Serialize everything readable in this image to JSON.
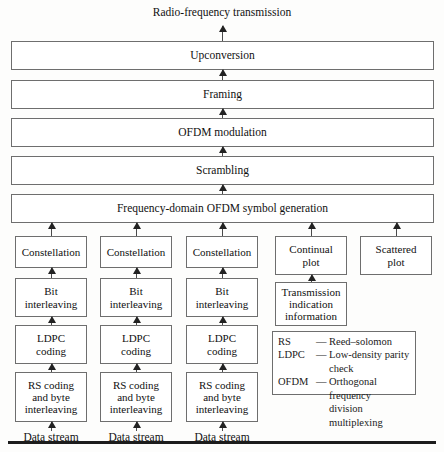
{
  "diagram": {
    "title": "Radio-frequency transmission",
    "stages": [
      {
        "label": "Upconversion"
      },
      {
        "label": "Framing"
      },
      {
        "label": "OFDM modulation"
      },
      {
        "label": "Scrambling"
      },
      {
        "label": "Frequency-domain OFDM symbol generation"
      }
    ],
    "columns": [
      {
        "constellation": "Constellation",
        "interleaving": "Bit\ninterleaving",
        "coding": "LDPC\ncoding",
        "rs": "RS coding\nand byte\ninterleaving",
        "input": "Data stream"
      },
      {
        "constellation": "Constellation",
        "interleaving": "Bit\ninterleaving",
        "coding": "LDPC\ncoding",
        "rs": "RS coding\nand byte\ninterleaving",
        "input": "Data stream"
      },
      {
        "constellation": "Constellation",
        "interleaving": "Bit\ninterleaving",
        "coding": "LDPC\ncoding",
        "rs": "RS coding\nand byte\ninterleaving",
        "input": "Data stream"
      }
    ],
    "pilots": {
      "continual": "Continual\nplot",
      "scattered": "Scattered\nplot",
      "transmission_info": "Transmission\nindication\ninformation"
    },
    "legend": [
      {
        "abbr": "RS",
        "dash": "—",
        "definition": "Reed–solomon",
        "continuation": ""
      },
      {
        "abbr": "LDPC",
        "dash": "—",
        "definition": "Low-density parity",
        "continuation": "check"
      },
      {
        "abbr": "OFDM",
        "dash": "—",
        "definition": "Orthogonal frequency",
        "continuation": "division multiplexing"
      }
    ]
  }
}
